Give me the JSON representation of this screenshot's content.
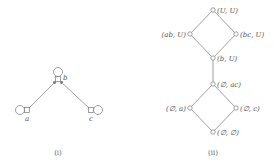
{
  "diagram_i": {
    "caption": "(i)",
    "nodes": [
      {
        "id": "b",
        "label": "b",
        "x": 58,
        "y": 79,
        "loop": "top"
      },
      {
        "id": "a",
        "label": "a",
        "x": 27,
        "y": 110,
        "loop": "left"
      },
      {
        "id": "c",
        "label": "c",
        "x": 91,
        "y": 110,
        "loop": "right"
      }
    ],
    "edges": [
      {
        "from": "a",
        "to": "b",
        "arrow": true
      },
      {
        "from": "c",
        "to": "b",
        "arrow": true
      }
    ]
  },
  "diagram_ii": {
    "caption": "(ii)",
    "nodes": [
      {
        "id": "UU",
        "label": "(U, U)",
        "x": 213,
        "y": 10
      },
      {
        "id": "abU",
        "label": "(ab, U)",
        "x": 190,
        "y": 34
      },
      {
        "id": "bcU",
        "label": "(bc, U)",
        "x": 236,
        "y": 34
      },
      {
        "id": "bU",
        "label": "(b, U)",
        "x": 213,
        "y": 58
      },
      {
        "id": "Eac",
        "label": "(∅, ac)",
        "x": 213,
        "y": 84
      },
      {
        "id": "Ea",
        "label": "(∅, a)",
        "x": 190,
        "y": 108
      },
      {
        "id": "Ec",
        "label": "(∅, c)",
        "x": 236,
        "y": 108
      },
      {
        "id": "EE",
        "label": "(∅, ∅)",
        "x": 213,
        "y": 132
      }
    ],
    "edges": [
      {
        "from": "UU",
        "to": "abU"
      },
      {
        "from": "UU",
        "to": "bcU"
      },
      {
        "from": "abU",
        "to": "bU"
      },
      {
        "from": "bcU",
        "to": "bU"
      },
      {
        "from": "bU",
        "to": "Eac"
      },
      {
        "from": "Eac",
        "to": "Ea"
      },
      {
        "from": "Eac",
        "to": "Ec"
      },
      {
        "from": "Ea",
        "to": "EE"
      },
      {
        "from": "Ec",
        "to": "EE"
      }
    ]
  }
}
